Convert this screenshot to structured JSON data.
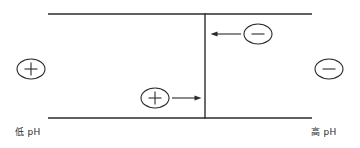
{
  "figure": {
    "type": "membrane-transport-diagram",
    "background_color": "#ffffff",
    "line_color": "#2b2b2b",
    "labels": {
      "left_ph": "低 pH",
      "right_ph": "高 pH"
    },
    "channel": {
      "top_line": {
        "x1": 48,
        "y1": 14,
        "x2": 312,
        "y2": 14
      },
      "bottom_line": {
        "x1": 48,
        "y1": 118,
        "x2": 312,
        "y2": 118
      },
      "barrier_line": {
        "x1": 205,
        "y1": 14,
        "x2": 205,
        "y2": 118
      }
    },
    "ions": [
      {
        "name": "left-exterior-cation",
        "charge": "+",
        "symbol": "＋",
        "cx": 31,
        "cy": 69,
        "rx": 14,
        "ry": 10,
        "region": "outside-left"
      },
      {
        "name": "right-exterior-anion",
        "charge": "-",
        "symbol": "－",
        "cx": 329,
        "cy": 69,
        "rx": 14,
        "ry": 10,
        "region": "outside-right"
      },
      {
        "name": "anion-entering-from-right",
        "charge": "-",
        "symbol": "－",
        "cx": 258,
        "cy": 34,
        "rx": 14,
        "ry": 10,
        "region": "inside-right-compartment"
      },
      {
        "name": "cation-entering-from-left",
        "charge": "+",
        "symbol": "＋",
        "cx": 155,
        "cy": 98,
        "rx": 14,
        "ry": 10,
        "region": "inside-left-compartment"
      }
    ],
    "arrows": [
      {
        "name": "anion-flux-arrow",
        "direction": "left",
        "x_start": 241,
        "x_end": 211,
        "y": 34,
        "describes": "negative ion moves leftward toward barrier"
      },
      {
        "name": "cation-flux-arrow",
        "direction": "right",
        "x_start": 171,
        "x_end": 201,
        "y": 98,
        "describes": "positive ion moves rightward toward barrier"
      }
    ]
  }
}
